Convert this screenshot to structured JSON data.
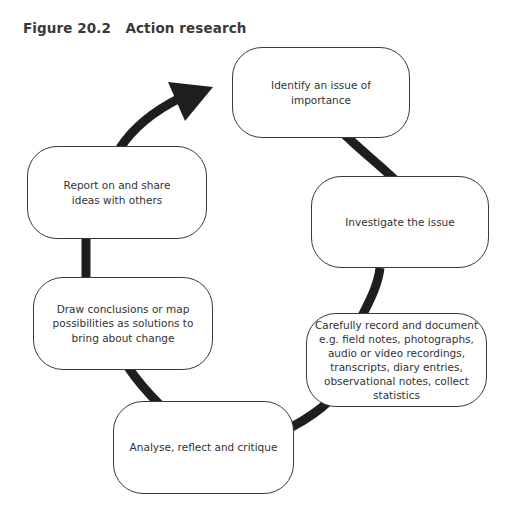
{
  "figure": {
    "title": "Figure 20.2   Action research",
    "type": "cycle",
    "arrow_direction": "clockwise",
    "steps": [
      {
        "id": 1,
        "label": "Identify an issue of importance"
      },
      {
        "id": 2,
        "label": "Investigate the issue"
      },
      {
        "id": 3,
        "label": "Carefully record and document e.g. field notes, photographs, audio or video recordings, transcripts, diary entries, observational notes, collect statistics"
      },
      {
        "id": 4,
        "label": "Analyse, reflect and critique"
      },
      {
        "id": 5,
        "label": "Draw conclusions or map possibilities as solutions to bring about change"
      },
      {
        "id": 6,
        "label": "Report on and share ideas with others"
      }
    ]
  },
  "colors": {
    "arrow": "#1e1e1e",
    "box_border": "#3a3a3a",
    "text": "#333333",
    "background": "#ffffff"
  }
}
